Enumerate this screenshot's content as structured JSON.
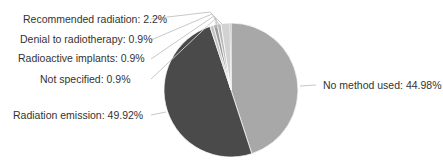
{
  "chart_data": {
    "type": "pie",
    "title": "",
    "start_angle_deg": 0,
    "direction": "clockwise",
    "slices": [
      {
        "label": "No method used",
        "value": 44.98,
        "display": "No method used: 44.98%",
        "color": "#a8a8a8"
      },
      {
        "label": "Radiation emission",
        "value": 49.92,
        "display": "Radiation emission: 49.92%",
        "color": "#4a4a4a"
      },
      {
        "label": "Not specified",
        "value": 0.9,
        "display": "Not specified: 0.9%",
        "color": "#c4c4c4"
      },
      {
        "label": "Radioactive implants",
        "value": 0.9,
        "display": "Radioactive implants: 0.9%",
        "color": "#9a9a9a"
      },
      {
        "label": "Denial to radiotherapy",
        "value": 0.9,
        "display": "Denial to radiotherapy: 0.9%",
        "color": "#b8b8b8"
      },
      {
        "label": "Recommended radiation",
        "value": 2.2,
        "display": "Recommended radiation: 2.2%",
        "color": "#d2d2d2"
      },
      {
        "label": "",
        "value": 0.2,
        "display": "",
        "color": "#555555"
      }
    ]
  },
  "labels": {
    "recommended": "Recommended radiation: 2.2%",
    "denial": "Denial to radiotherapy: 0.9%",
    "implants": "Radioactive implants: 0.9%",
    "not_specified": "Not specified: 0.9%",
    "emission": "Radiation emission: 49.92%",
    "no_method": "No method used: 44.98%"
  }
}
